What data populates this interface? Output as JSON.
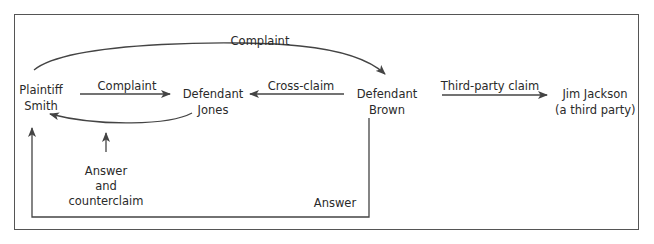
{
  "nodes": {
    "plaintiff": {
      "line1": "Plaintiff",
      "line2": "Smith"
    },
    "jones": {
      "line1": "Defendant",
      "line2": "Jones"
    },
    "brown": {
      "line1": "Defendant",
      "line2": "Brown"
    },
    "jackson": {
      "line1": "Jim Jackson",
      "line2": "(a third party)"
    }
  },
  "edges": {
    "complaint_top": "Complaint",
    "complaint_mid": "Complaint",
    "cross_claim": "Cross-claim",
    "third_party": "Third-party claim",
    "answer_counter": {
      "line1": "Answer",
      "line2": "and",
      "line3": "counterclaim"
    },
    "answer": "Answer"
  },
  "colors": {
    "line": "#444444",
    "text": "#2a2a2a",
    "frame": "#555555"
  }
}
